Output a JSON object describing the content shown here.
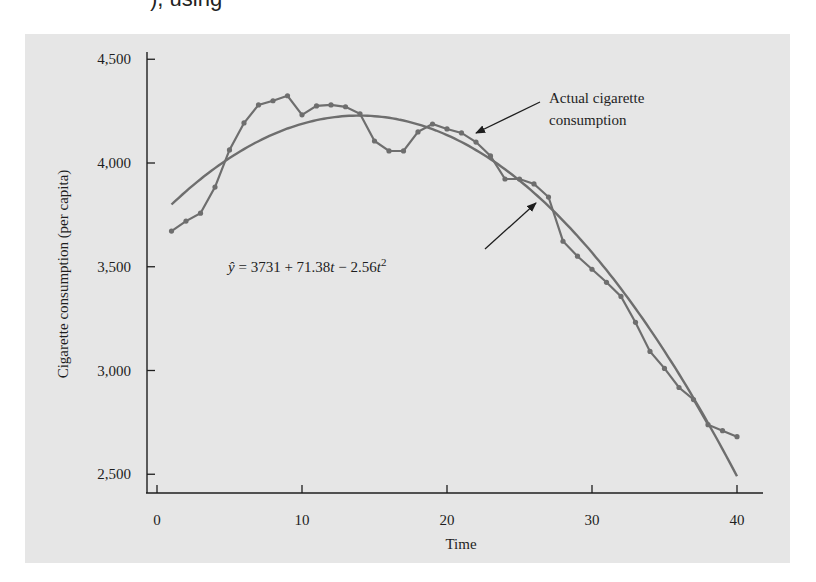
{
  "page": {
    "top_fragment": "), using"
  },
  "chart_data": {
    "type": "line",
    "title": "",
    "xlabel": "Time",
    "ylabel": "Cigarette consumption (per capita)",
    "xlim": [
      0,
      40
    ],
    "ylim": [
      2500,
      4500
    ],
    "x_ticks": [
      0,
      10,
      20,
      30,
      40
    ],
    "x_tick_labels": [
      "0",
      "10",
      "20",
      "30",
      "40"
    ],
    "y_ticks": [
      2500,
      3000,
      3500,
      4000,
      4500
    ],
    "y_tick_labels": [
      "2,500",
      "3,000",
      "3,500",
      "4,000",
      "4,500"
    ],
    "grid": false,
    "legend": "none (annotations used)",
    "x": [
      1,
      2,
      3,
      4,
      5,
      6,
      7,
      8,
      9,
      10,
      11,
      12,
      13,
      14,
      15,
      16,
      17,
      18,
      19,
      20,
      21,
      22,
      23,
      24,
      25,
      26,
      27,
      28,
      29,
      30,
      31,
      32,
      33,
      34,
      35,
      36,
      37,
      38,
      39,
      40
    ],
    "series": [
      {
        "name": "Actual cigarette consumption",
        "style": "line with markers",
        "color": "#6e6e6e",
        "values": [
          3672,
          3720,
          3758,
          3884,
          4063,
          4193,
          4280,
          4300,
          4324,
          4232,
          4275,
          4280,
          4271,
          4237,
          4106,
          4058,
          4058,
          4150,
          4188,
          4164,
          4145,
          4101,
          4034,
          3923,
          3923,
          3899,
          3836,
          3623,
          3551,
          3488,
          3425,
          3357,
          3232,
          3092,
          3010,
          2918,
          2860,
          2739,
          2710,
          2681
        ]
      },
      {
        "name": "Fitted quadratic trend",
        "style": "smooth line",
        "color": "#6e6e6e",
        "equation": "ŷ = 3731 + 71.38t − 2.56t²",
        "coefficients": {
          "intercept": 3731,
          "t": 71.38,
          "t2": -2.56
        }
      }
    ],
    "annotations": [
      {
        "text_lines": [
          "Actual cigarette",
          "consumption"
        ],
        "points_to": "Actual cigarette consumption"
      },
      {
        "text": "ŷ = 3731 + 71.38t − 2.56t²",
        "points_to": "Fitted quadratic trend"
      }
    ]
  }
}
